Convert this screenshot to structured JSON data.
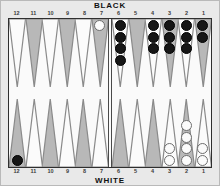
{
  "labels": {
    "top_player": "BLACK",
    "bottom_player": "WHITE"
  },
  "point_numbers": {
    "top": [
      "12",
      "11",
      "10",
      "9",
      "8",
      "7",
      "6",
      "5",
      "4",
      "3",
      "2",
      "1"
    ],
    "bottom": [
      "12",
      "11",
      "10",
      "9",
      "8",
      "7",
      "6",
      "5",
      "4",
      "3",
      "2",
      "1"
    ]
  },
  "colors": {
    "frame": "#e9e9e9",
    "field": "#fafafa",
    "point_dark": "#b8b8b8",
    "point_light": "#fbfbfb",
    "point_outline": "#8a8a8a",
    "checker_black": "#161616",
    "checker_white": "#fbfbfb",
    "border": "#2f2f2f",
    "text": "#111111"
  },
  "chart_data": {
    "type": "table",
    "categories": [
      "12",
      "11",
      "10",
      "9",
      "8",
      "7",
      "6",
      "5",
      "4",
      "3",
      "2",
      "1"
    ],
    "series": [
      {
        "name": "BLACK top row (points 12-1)",
        "values": [
          0,
          0,
          0,
          0,
          0,
          0,
          4,
          0,
          3,
          3,
          3,
          2
        ]
      },
      {
        "name": "WHITE top row (points 12-1)",
        "values": [
          0,
          0,
          0,
          0,
          0,
          1,
          0,
          0,
          0,
          0,
          0,
          0
        ]
      },
      {
        "name": "BLACK bottom row (points 12-1)",
        "values": [
          1,
          0,
          0,
          0,
          0,
          0,
          0,
          0,
          0,
          0,
          0,
          0
        ]
      },
      {
        "name": "WHITE bottom row (points 12-1)",
        "values": [
          0,
          0,
          0,
          0,
          0,
          0,
          0,
          0,
          0,
          2,
          4,
          2
        ]
      }
    ]
  },
  "top_row": [
    {
      "point": "12",
      "color": "none",
      "count": 0,
      "shade": "light"
    },
    {
      "point": "11",
      "color": "none",
      "count": 0,
      "shade": "dark"
    },
    {
      "point": "10",
      "color": "none",
      "count": 0,
      "shade": "light"
    },
    {
      "point": "9",
      "color": "none",
      "count": 0,
      "shade": "dark"
    },
    {
      "point": "8",
      "color": "none",
      "count": 0,
      "shade": "light"
    },
    {
      "point": "7",
      "color": "white",
      "count": 1,
      "shade": "dark"
    },
    {
      "point": "6",
      "color": "black",
      "count": 4,
      "shade": "light"
    },
    {
      "point": "5",
      "color": "none",
      "count": 0,
      "shade": "dark"
    },
    {
      "point": "4",
      "color": "black",
      "count": 3,
      "shade": "light"
    },
    {
      "point": "3",
      "color": "black",
      "count": 3,
      "shade": "dark"
    },
    {
      "point": "2",
      "color": "black",
      "count": 3,
      "shade": "light"
    },
    {
      "point": "1",
      "color": "black",
      "count": 2,
      "shade": "dark"
    }
  ],
  "bottom_row": [
    {
      "point": "12",
      "color": "black",
      "count": 1,
      "shade": "dark"
    },
    {
      "point": "11",
      "color": "none",
      "count": 0,
      "shade": "light"
    },
    {
      "point": "10",
      "color": "none",
      "count": 0,
      "shade": "dark"
    },
    {
      "point": "9",
      "color": "none",
      "count": 0,
      "shade": "light"
    },
    {
      "point": "8",
      "color": "none",
      "count": 0,
      "shade": "dark"
    },
    {
      "point": "7",
      "color": "none",
      "count": 0,
      "shade": "light"
    },
    {
      "point": "6",
      "color": "none",
      "count": 0,
      "shade": "dark"
    },
    {
      "point": "5",
      "color": "none",
      "count": 0,
      "shade": "light"
    },
    {
      "point": "4",
      "color": "none",
      "count": 0,
      "shade": "dark"
    },
    {
      "point": "3",
      "color": "white",
      "count": 2,
      "shade": "light"
    },
    {
      "point": "2",
      "color": "white",
      "count": 4,
      "shade": "dark"
    },
    {
      "point": "1",
      "color": "white",
      "count": 2,
      "shade": "light"
    }
  ]
}
